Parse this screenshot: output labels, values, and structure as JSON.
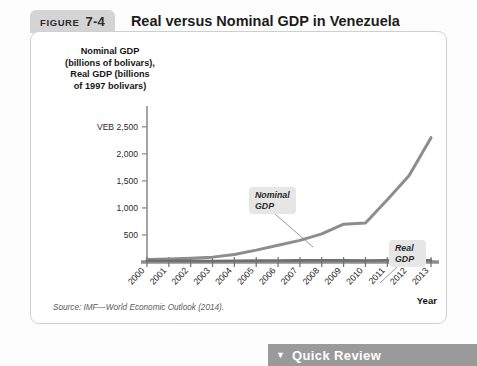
{
  "figure": {
    "badge_word": "FIGURE",
    "badge_number": "7-4",
    "title": "Real versus Nominal GDP in Venezuela",
    "source": "Source: IMF—World Economic Outlook (2014)."
  },
  "quick_review": {
    "caret": "▼",
    "label": "Quick Review"
  },
  "chart_data": {
    "type": "line",
    "title": "Real versus Nominal GDP in Venezuela",
    "xlabel": "Year",
    "ylabel": "Nominal GDP (billions of bolivars), Real GDP (billions of 1997 bolivars)",
    "ylabel_lines": [
      "Nominal GDP",
      "(billions of bolivars),",
      "Real GDP (billions",
      "of 1997 bolivars)"
    ],
    "y_unit_prefix": "VEB",
    "x": [
      2000,
      2001,
      2002,
      2003,
      2004,
      2005,
      2006,
      2007,
      2008,
      2009,
      2010,
      2011,
      2012,
      2013
    ],
    "categories": [
      "2000",
      "2001",
      "2002",
      "2003",
      "2004",
      "2005",
      "2006",
      "2007",
      "2008",
      "2009",
      "2010",
      "2011",
      "2012",
      "2013"
    ],
    "ytick_labels": [
      "500",
      "1,000",
      "1,500",
      "2,000",
      "VEB 2,500"
    ],
    "yticks": [
      500,
      1000,
      1500,
      2000,
      2500
    ],
    "ylim": [
      0,
      2700
    ],
    "xlim": [
      2000,
      2013
    ],
    "grid": false,
    "legend": "annotations",
    "series": [
      {
        "name": "Nominal GDP",
        "color": "#8d8d8d",
        "values": [
          48,
          57,
          70,
          90,
          140,
          220,
          310,
          400,
          520,
          700,
          720,
          1150,
          1600,
          2300
        ]
      },
      {
        "name": "Real GDP",
        "color": "#6f6f6f",
        "values": [
          22,
          23,
          21,
          19,
          23,
          25,
          28,
          30,
          31,
          30,
          29,
          31,
          33,
          33
        ]
      }
    ],
    "annotations": [
      {
        "label": "Nominal GDP",
        "lines": [
          "Nominal",
          "GDP"
        ],
        "points_to_year": 2007
      },
      {
        "label": "Real GDP",
        "lines": [
          "Real",
          "GDP"
        ],
        "points_to_year": 2011
      }
    ]
  }
}
